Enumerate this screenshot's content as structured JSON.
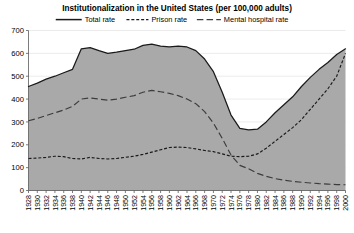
{
  "chart_data": {
    "type": "area",
    "title": "Institutionalization in the United States (per 100,000 adults)",
    "xlabel": "",
    "ylabel": "",
    "xlim": [
      1928,
      2000
    ],
    "ylim": [
      0,
      700
    ],
    "ytick_step": 100,
    "grid": true,
    "legend_position": "top",
    "fill_color": "#a9a9a9",
    "line_color": "#1a1a1a",
    "categories": [
      1928,
      1930,
      1932,
      1934,
      1936,
      1938,
      1940,
      1942,
      1944,
      1946,
      1948,
      1950,
      1952,
      1954,
      1956,
      1958,
      1960,
      1962,
      1964,
      1966,
      1968,
      1970,
      1972,
      1974,
      1976,
      1978,
      1980,
      1982,
      1984,
      1986,
      1988,
      1990,
      1992,
      1994,
      1996,
      1998,
      2000
    ],
    "ytick_labels": [
      "0",
      "100",
      "200",
      "300",
      "400",
      "500",
      "600",
      "700"
    ],
    "xtick_labels": [
      "1928",
      "1930",
      "1932",
      "1934",
      "1936",
      "1938",
      "1940",
      "1942",
      "1944",
      "1946",
      "1948",
      "1950",
      "1952",
      "1954",
      "1956",
      "1958",
      "1960",
      "1962",
      "1964",
      "1966",
      "1968",
      "1970",
      "1972",
      "1974",
      "1976",
      "1978",
      "1980",
      "1982",
      "1984",
      "1986",
      "1988",
      "1990",
      "1992",
      "1994",
      "1996",
      "1998",
      "2000"
    ],
    "series": [
      {
        "name": "Total rate",
        "style": "solid",
        "values": [
          455,
          470,
          487,
          500,
          515,
          530,
          620,
          625,
          612,
          600,
          605,
          612,
          618,
          635,
          640,
          632,
          628,
          632,
          628,
          612,
          575,
          520,
          430,
          330,
          272,
          265,
          268,
          300,
          340,
          375,
          410,
          455,
          495,
          530,
          560,
          595,
          620
        ]
      },
      {
        "name": "Prison rate",
        "style": "short-dash",
        "values": [
          140,
          142,
          145,
          150,
          148,
          140,
          138,
          145,
          140,
          138,
          140,
          145,
          150,
          158,
          168,
          178,
          188,
          190,
          188,
          182,
          175,
          170,
          160,
          150,
          148,
          150,
          160,
          185,
          215,
          245,
          275,
          310,
          355,
          400,
          445,
          500,
          600
        ]
      },
      {
        "name": "Mental hospital rate",
        "style": "long-dash",
        "values": [
          305,
          315,
          328,
          340,
          352,
          368,
          400,
          405,
          400,
          395,
          400,
          408,
          415,
          430,
          438,
          432,
          425,
          415,
          400,
          380,
          345,
          295,
          228,
          155,
          110,
          95,
          75,
          62,
          52,
          45,
          40,
          36,
          33,
          30,
          28,
          26,
          25
        ]
      }
    ]
  },
  "legend": {
    "items": [
      {
        "label": "Total rate",
        "style": "solid"
      },
      {
        "label": "Prison rate",
        "style": "short-dash"
      },
      {
        "label": "Mental hospital rate",
        "style": "long-dash"
      }
    ]
  }
}
